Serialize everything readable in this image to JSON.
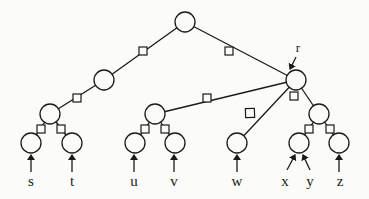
{
  "diagram": {
    "type": "tree",
    "colors": {
      "stroke": "#1a1a1a",
      "fill": "#fbfbf9"
    },
    "node_radius": 10,
    "nodes": [
      {
        "id": "root",
        "x": 185,
        "y": 22
      },
      {
        "id": "left",
        "x": 104,
        "y": 80
      },
      {
        "id": "r",
        "x": 296,
        "y": 80,
        "label": "r"
      },
      {
        "id": "ll",
        "x": 50,
        "y": 114
      },
      {
        "id": "mid",
        "x": 155,
        "y": 114
      },
      {
        "id": "rr",
        "x": 319,
        "y": 114
      },
      {
        "id": "s",
        "x": 31,
        "y": 143
      },
      {
        "id": "t",
        "x": 72,
        "y": 143
      },
      {
        "id": "u",
        "x": 135,
        "y": 143
      },
      {
        "id": "v",
        "x": 175,
        "y": 143
      },
      {
        "id": "w",
        "x": 237,
        "y": 143
      },
      {
        "id": "xy",
        "x": 299,
        "y": 143
      },
      {
        "id": "z",
        "x": 339,
        "y": 143
      }
    ],
    "edges": [
      {
        "from": "root",
        "to": "left",
        "marker": "square",
        "mx": 143,
        "my": 51
      },
      {
        "from": "root",
        "to": "r",
        "marker": "square",
        "mx": 229,
        "my": 51
      },
      {
        "from": "left",
        "to": "ll",
        "marker": "square",
        "mx": 77,
        "my": 98
      },
      {
        "from": "r",
        "to": "mid",
        "marker": "square",
        "mx": 207,
        "my": 98
      },
      {
        "from": "r",
        "to": "w",
        "marker": "diamond",
        "mx": 250,
        "my": 113
      },
      {
        "from": "r",
        "to": "rr",
        "marker": "square",
        "mx": 294,
        "my": 96
      },
      {
        "from": "ll",
        "to": "s",
        "marker": "square",
        "mx": 41,
        "my": 129
      },
      {
        "from": "ll",
        "to": "t",
        "marker": "square",
        "mx": 61,
        "my": 129
      },
      {
        "from": "mid",
        "to": "u",
        "marker": "square",
        "mx": 145,
        "my": 129
      },
      {
        "from": "mid",
        "to": "v",
        "marker": "square",
        "mx": 165,
        "my": 129
      },
      {
        "from": "rr",
        "to": "xy",
        "marker": "square",
        "mx": 309,
        "my": 129
      },
      {
        "from": "rr",
        "to": "z",
        "marker": "square",
        "mx": 330,
        "my": 129
      }
    ],
    "r_label": {
      "text": "r",
      "x": 298,
      "y": 52,
      "arrow_from": [
        296,
        57
      ],
      "arrow_to": [
        290,
        69
      ]
    },
    "inputs": [
      {
        "label": "s",
        "x": 31,
        "lx": 31,
        "ax1": 31,
        "ay1": 172,
        "ax2": 31,
        "ay2": 155
      },
      {
        "label": "t",
        "x": 72,
        "lx": 72,
        "ax1": 72,
        "ay1": 172,
        "ax2": 72,
        "ay2": 155
      },
      {
        "label": "u",
        "x": 135,
        "lx": 134,
        "ax1": 134,
        "ay1": 172,
        "ax2": 134,
        "ay2": 155
      },
      {
        "label": "v",
        "x": 175,
        "lx": 174,
        "ax1": 174,
        "ay1": 172,
        "ax2": 174,
        "ay2": 155
      },
      {
        "label": "w",
        "x": 237,
        "lx": 237,
        "ax1": 237,
        "ay1": 172,
        "ax2": 237,
        "ay2": 155
      },
      {
        "label": "x",
        "x": 285,
        "lx": 285,
        "ax1": 287,
        "ay1": 170,
        "ax2": 295,
        "ay2": 155
      },
      {
        "label": "y",
        "x": 310,
        "lx": 310,
        "ax1": 310,
        "ay1": 170,
        "ax2": 303,
        "ay2": 155
      },
      {
        "label": "z",
        "x": 340,
        "lx": 340,
        "ax1": 339,
        "ay1": 172,
        "ax2": 339,
        "ay2": 155
      }
    ],
    "label_y": 186
  }
}
